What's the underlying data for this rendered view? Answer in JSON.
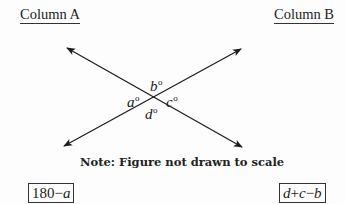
{
  "columns": {
    "a_heading": "Column A",
    "b_heading": "Column B"
  },
  "figure": {
    "lines": [
      {
        "name": "line-1",
        "from": [
          67,
          48
        ],
        "to": [
          242,
          147
        ],
        "arrows": "both"
      },
      {
        "name": "line-2",
        "from": [
          64,
          146
        ],
        "to": [
          241,
          49
        ],
        "arrows": "both"
      }
    ],
    "intersection": [
      154,
      98
    ],
    "angles": {
      "top": {
        "var": "b",
        "unit": "o"
      },
      "left": {
        "var": "a",
        "unit": "o"
      },
      "right": {
        "var": "c",
        "unit": "o"
      },
      "bottom": {
        "var": "d",
        "unit": "o"
      }
    },
    "line_color": "#1e1e1e"
  },
  "note": "Note: Figure not drawn to scale",
  "quantities": {
    "column_a": {
      "number": "180",
      "operator": "−",
      "var": "a"
    },
    "column_b": {
      "var1": "d",
      "op1": "+",
      "var2": "c",
      "op2": "−",
      "var3": "b"
    }
  }
}
